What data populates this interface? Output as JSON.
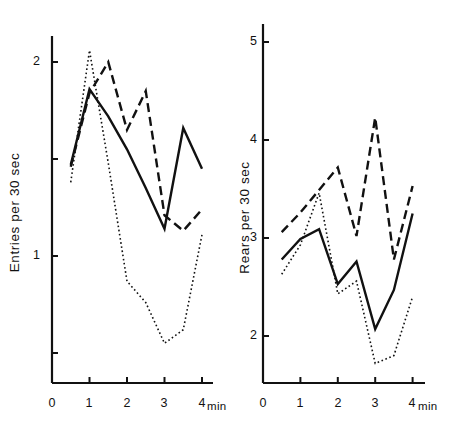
{
  "figure": {
    "background": "#ffffff",
    "ink_color": "#111111"
  },
  "chart_data": [
    {
      "panel_id": "left",
      "type": "line",
      "title": "",
      "xlabel": "min",
      "ylabel": "Entries  per  30 sec",
      "xlim": [
        0,
        4.3
      ],
      "ylim": [
        0.35,
        2.25
      ],
      "grid": false,
      "legend": "none",
      "x_ticks": [
        0,
        1,
        2,
        3,
        4
      ],
      "x_tick_labels": [
        "0",
        "1",
        "2",
        "3",
        "4"
      ],
      "y_ticks": [
        0.5,
        1,
        1.5,
        2
      ],
      "y_tick_labels": [
        "",
        "1",
        "",
        "2"
      ],
      "x": [
        0.5,
        1,
        1.5,
        2,
        2.5,
        3,
        3.5,
        4
      ],
      "series": [
        {
          "name": "solid",
          "style": "solid",
          "values": [
            1.47,
            1.86,
            1.72,
            1.55,
            1.35,
            1.14,
            1.66,
            1.45
          ]
        },
        {
          "name": "dashed",
          "style": "dashed",
          "values": [
            1.46,
            1.84,
            2.0,
            1.65,
            1.85,
            1.21,
            1.13,
            1.24
          ]
        },
        {
          "name": "dotted",
          "style": "dotted",
          "values": [
            1.38,
            2.06,
            1.48,
            0.87,
            0.76,
            0.55,
            0.62,
            1.11
          ]
        }
      ]
    },
    {
      "panel_id": "right",
      "type": "line",
      "title": "",
      "xlabel": "min",
      "ylabel": "Rears  per  30 sec",
      "xlim": [
        0,
        4.3
      ],
      "ylim": [
        1.5,
        5.25
      ],
      "grid": false,
      "legend": "none",
      "x_ticks": [
        0,
        1,
        2,
        3,
        4
      ],
      "x_tick_labels": [
        "0",
        "1",
        "2",
        "3",
        "4"
      ],
      "y_ticks": [
        2,
        3,
        4,
        5
      ],
      "y_tick_labels": [
        "2",
        "3",
        "4",
        "5"
      ],
      "x": [
        0.5,
        1,
        1.5,
        2,
        2.5,
        3,
        3.5,
        4
      ],
      "series": [
        {
          "name": "solid",
          "style": "solid",
          "values": [
            2.78,
            2.99,
            3.09,
            2.53,
            2.76,
            2.07,
            2.47,
            3.25
          ]
        },
        {
          "name": "dashed",
          "style": "dashed",
          "values": [
            3.06,
            3.26,
            3.49,
            3.72,
            3.02,
            4.23,
            2.78,
            3.53
          ]
        },
        {
          "name": "dotted",
          "style": "dotted",
          "values": [
            2.63,
            2.93,
            3.46,
            2.43,
            2.56,
            1.72,
            1.8,
            2.4
          ]
        }
      ]
    }
  ],
  "panels": {
    "left": {
      "y_axis_label": "Entries  per  30 sec",
      "x_unit_label": "min",
      "y_tick_labels": [
        "2",
        "1"
      ],
      "x_tick_labels": [
        "0",
        "1",
        "2",
        "3",
        "4"
      ]
    },
    "right": {
      "y_axis_label": "Rears  per  30 sec",
      "x_unit_label": "min",
      "y_tick_labels": [
        "5",
        "4",
        "3",
        "2"
      ],
      "x_tick_labels": [
        "0",
        "1",
        "2",
        "3",
        "4"
      ]
    }
  }
}
